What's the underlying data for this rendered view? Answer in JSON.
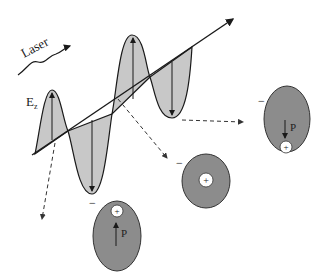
{
  "diagram": {
    "laser_label": "Laser",
    "field_label": "E",
    "field_subscript": "z",
    "dipole_label": "P",
    "plus_sign": "+",
    "minus_sign": "−",
    "colors": {
      "wave_fill": "#c8c8c8",
      "atom_fill": "#8c8c8c",
      "nucleus_fill": "#ffffff",
      "line": "#1a1a1a",
      "dashed": "#333333"
    },
    "atoms": [
      {
        "id": "atom-right",
        "state": "polarized-down",
        "dipole": "down"
      },
      {
        "id": "atom-middle",
        "state": "unpolarized",
        "dipole": "none"
      },
      {
        "id": "atom-bottom",
        "state": "polarized-up",
        "dipole": "up"
      }
    ]
  }
}
